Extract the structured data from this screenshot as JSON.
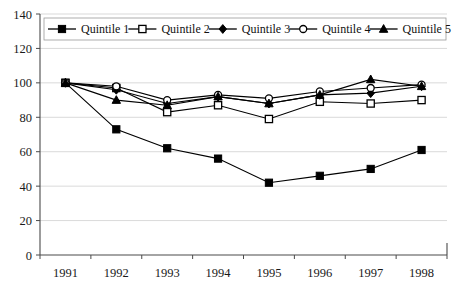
{
  "chart_data": {
    "type": "line",
    "title": "",
    "xlabel": "",
    "ylabel": "",
    "categories": [
      "1991",
      "1992",
      "1993",
      "1994",
      "1995",
      "1996",
      "1997",
      "1998"
    ],
    "x": [
      1991,
      1992,
      1993,
      1994,
      1995,
      1996,
      1997,
      1998
    ],
    "ylim": [
      0,
      140
    ],
    "y_ticks": [
      0,
      20,
      40,
      60,
      80,
      100,
      120,
      140
    ],
    "y_tick_labels": [
      "0",
      "20",
      "40",
      "60",
      "80",
      "100",
      "120",
      "140"
    ],
    "grid": true,
    "grid_axis": "y",
    "legend_position": "top-inside",
    "series": [
      {
        "name": "Quintile 1",
        "marker": "filled-square",
        "values": [
          100,
          73,
          62,
          56,
          42,
          46,
          50,
          61
        ]
      },
      {
        "name": "Quintile 2",
        "marker": "open-square",
        "values": [
          100,
          97,
          83,
          87,
          79,
          89,
          88,
          90
        ]
      },
      {
        "name": "Quintile 3",
        "marker": "filled-diamond",
        "values": [
          100,
          96,
          88,
          92,
          88,
          93,
          94,
          98
        ]
      },
      {
        "name": "Quintile 4",
        "marker": "open-circle",
        "values": [
          100,
          98,
          90,
          93,
          91,
          95,
          97,
          99
        ]
      },
      {
        "name": "Quintile 5",
        "marker": "filled-triangle",
        "values": [
          100,
          90,
          87,
          92,
          88,
          93,
          102,
          98
        ]
      }
    ]
  },
  "legend": {
    "items": [
      {
        "label": "Quintile 1",
        "marker": "filled-square"
      },
      {
        "label": "Quintile 2",
        "marker": "open-square"
      },
      {
        "label": "Quintile 3",
        "marker": "filled-diamond"
      },
      {
        "label": "Quintile 4",
        "marker": "open-circle"
      },
      {
        "label": "Quintile 5",
        "marker": "filled-triangle"
      }
    ]
  },
  "colors": {
    "series": "#000000",
    "grid": "#c9c9c9",
    "axis": "#4a4a4a",
    "background": "#ffffff"
  }
}
